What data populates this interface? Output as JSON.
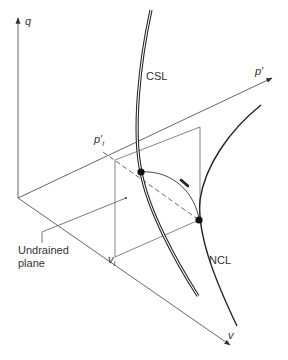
{
  "figure": {
    "type": "3D state-space schematic",
    "axes": {
      "q": "q",
      "p_prime": "p′",
      "v": "v"
    },
    "lines": {
      "csl": "CSL",
      "ncl": "NCL"
    },
    "labels": {
      "p_i_base": "p′",
      "p_i_sub": "i",
      "v_i_base": "v",
      "v_i_sub": "i",
      "undrained_line1": "Undrained",
      "undrained_line2": "plane"
    },
    "colors": {
      "axis": "#555555",
      "curve": "#222222",
      "text": "#333333",
      "background": "#ffffff"
    }
  }
}
